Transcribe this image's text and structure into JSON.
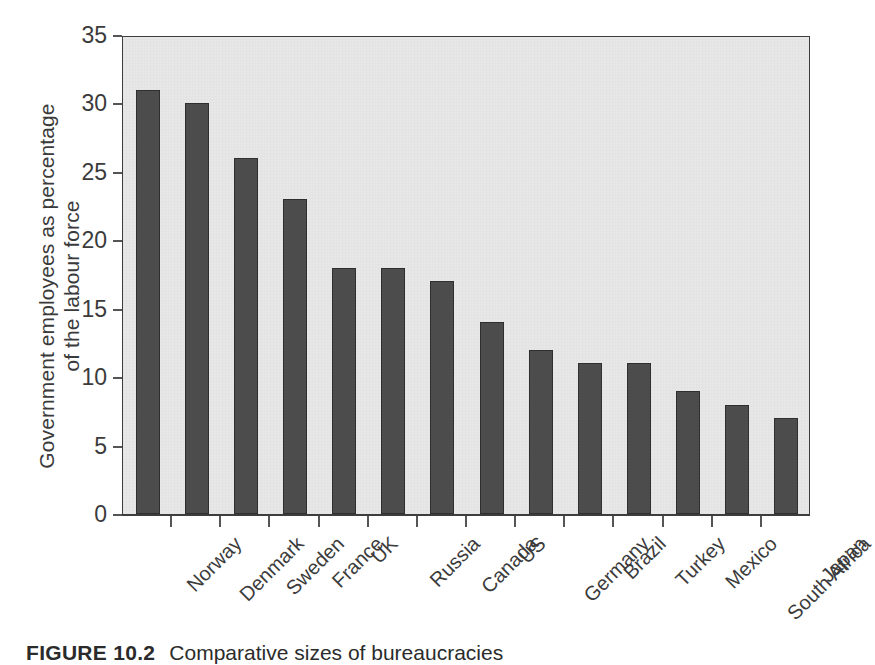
{
  "chart_data": {
    "type": "bar",
    "title": "",
    "xlabel": "",
    "ylabel": "Government employees as percentage of the labour force",
    "ylabel_lines": [
      "Government employees as percentage",
      "of the labour force"
    ],
    "ylim": [
      0,
      35
    ],
    "yticks": [
      0,
      5,
      10,
      15,
      20,
      25,
      30,
      35
    ],
    "ytick_labels": [
      "0",
      "5",
      "10",
      "15",
      "20",
      "25",
      "30",
      "35"
    ],
    "grid": false,
    "legend": "none",
    "xtick_rotation": -45,
    "categories": [
      "Norway",
      "Denmark",
      "Sweden",
      "France",
      "UK",
      "Russia",
      "Canada",
      "US",
      "Germany",
      "Brazil",
      "Turkey",
      "Mexico",
      "South Africa",
      "Japan"
    ],
    "values": [
      31,
      30,
      26,
      23,
      18,
      18,
      17,
      14,
      12,
      11,
      11,
      9,
      8,
      7
    ],
    "bar_color": "#4d4d4d",
    "bar_edge_color": "#2f2f2f",
    "plot_background": "#e7e7e7",
    "axis_color": "#3d3d3d"
  },
  "caption": {
    "label": "FIGURE 10.2",
    "text": "Comparative sizes of bureaucracies"
  }
}
